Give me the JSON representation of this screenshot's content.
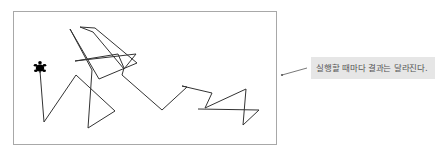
{
  "canvas": {
    "border_color": "#a8a8a8",
    "line_color": "#333333",
    "turtle": {
      "icon": "turtle-icon",
      "x": 40,
      "y": 71,
      "color": "#000000"
    },
    "path_points": "40,71 44,122 76,75 115,111 88,128 92,70 70,29 99,79 137,63 95,28 80,27 93,32 124,69 136,54 75,61 118,54 124,68 122,75 162,110 187,87 182,86 212,93 205,108 246,89 243,125 259,110 198,109"
  },
  "callout": {
    "text": "실행할 때마다 결과는 달라진다.",
    "background": "#e6e6e6",
    "leader_line": {
      "x1": 282,
      "y1": 75,
      "x2": 307,
      "y2": 68
    }
  }
}
